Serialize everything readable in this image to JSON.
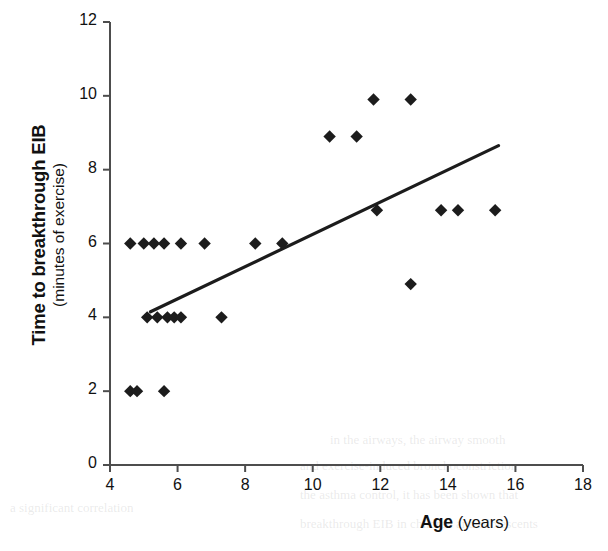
{
  "chart_data": {
    "type": "scatter",
    "title": "",
    "xlabel": "Age (years)",
    "xlabel_bold_part": "Age",
    "xlabel_regular_part": "(years)",
    "ylabel": "Time to breakthrough EIB",
    "ylabel_sub": "(minutes of exercise)",
    "xlim": [
      4,
      18
    ],
    "ylim": [
      0,
      12
    ],
    "xticks": [
      4,
      6,
      8,
      10,
      12,
      14,
      16,
      18
    ],
    "yticks": [
      0,
      2,
      4,
      6,
      8,
      10,
      12
    ],
    "grid": false,
    "legend": "none",
    "marker": "diamond",
    "marker_color": "#1c1c1c",
    "line_color": "#1c1c1c",
    "axis_color": "#4d4d4d",
    "points": [
      {
        "x": 4.6,
        "y": 2.0
      },
      {
        "x": 4.8,
        "y": 2.0
      },
      {
        "x": 5.6,
        "y": 2.0
      },
      {
        "x": 5.1,
        "y": 4.0
      },
      {
        "x": 5.4,
        "y": 4.0
      },
      {
        "x": 5.7,
        "y": 4.0
      },
      {
        "x": 5.9,
        "y": 4.0
      },
      {
        "x": 6.1,
        "y": 4.0
      },
      {
        "x": 7.3,
        "y": 4.0
      },
      {
        "x": 4.6,
        "y": 6.0
      },
      {
        "x": 5.0,
        "y": 6.0
      },
      {
        "x": 5.3,
        "y": 6.0
      },
      {
        "x": 5.6,
        "y": 6.0
      },
      {
        "x": 6.1,
        "y": 6.0
      },
      {
        "x": 6.8,
        "y": 6.0
      },
      {
        "x": 8.3,
        "y": 6.0
      },
      {
        "x": 9.1,
        "y": 6.0
      },
      {
        "x": 12.9,
        "y": 4.9
      },
      {
        "x": 11.9,
        "y": 6.9
      },
      {
        "x": 13.8,
        "y": 6.9
      },
      {
        "x": 14.3,
        "y": 6.9
      },
      {
        "x": 15.4,
        "y": 6.9
      },
      {
        "x": 10.5,
        "y": 8.9
      },
      {
        "x": 11.3,
        "y": 8.9
      },
      {
        "x": 11.8,
        "y": 9.9
      },
      {
        "x": 12.9,
        "y": 9.9
      }
    ],
    "trendline": {
      "x0": 5.2,
      "y0": 4.15,
      "x1": 15.5,
      "y1": 8.65
    }
  },
  "ghost_text": [
    {
      "text": "in the airways, the airway smooth",
      "x": 330,
      "y": 432
    },
    {
      "text": "and exercise-induced bronchoconstriction",
      "x": 300,
      "y": 458
    },
    {
      "text": "the asthma control, it has been shown that",
      "x": 300,
      "y": 487
    },
    {
      "text": "breakthrough EIB in children and adolescents",
      "x": 300,
      "y": 516
    },
    {
      "text": "a significant correlation",
      "x": 10,
      "y": 500
    }
  ]
}
